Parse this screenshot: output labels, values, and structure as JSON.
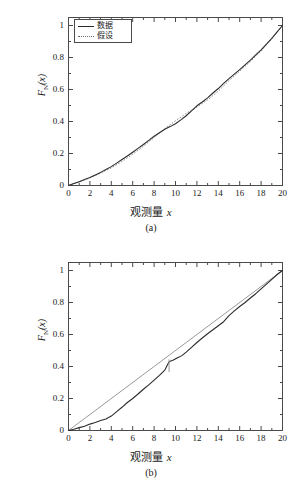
{
  "figure": {
    "background_color": "#ffffff",
    "data_line_color": "#2b2b2b",
    "hypothesis_line_color": "#8c8c8c",
    "axis_color": "#4a4a4a"
  },
  "panels": [
    {
      "id": "a",
      "caption": "(a)",
      "xlabel_cn": "观测量",
      "xlabel_var": "x",
      "ylabel_main": "F",
      "ylabel_sub": "N",
      "ylabel_arg": "(x)",
      "legend": {
        "visible": true,
        "items": [
          {
            "label": "数据",
            "style": "solid"
          },
          {
            "label": "假设",
            "style": "dotted"
          }
        ]
      }
    },
    {
      "id": "b",
      "caption": "(b)",
      "xlabel_cn": "观测量",
      "xlabel_var": "x",
      "ylabel_main": "F",
      "ylabel_sub": "N",
      "ylabel_arg": "(x)",
      "legend": {
        "visible": false,
        "items": []
      }
    }
  ],
  "bottom_text": "",
  "chart_data": [
    {
      "type": "line",
      "panel": "a",
      "title": "(a)",
      "xlabel": "观测量 x",
      "ylabel": "F_N(x)",
      "xlim": [
        0,
        20
      ],
      "ylim": [
        0,
        1.05
      ],
      "xticks": [
        0,
        2,
        4,
        6,
        8,
        10,
        12,
        14,
        16,
        18,
        20
      ],
      "yticks": [
        0,
        0.2,
        0.4,
        0.6,
        0.8,
        1
      ],
      "grid": false,
      "legend": [
        "数据",
        "假设"
      ],
      "legend_position": "upper-left",
      "series": [
        {
          "name": "数据",
          "style": "solid",
          "color": "#2b2b2b",
          "x": [
            0,
            0.5,
            1,
            1.5,
            2,
            2.5,
            3,
            3.5,
            4,
            4.5,
            5,
            5.5,
            6,
            6.5,
            7,
            7.5,
            8,
            8.5,
            9,
            9.5,
            10,
            10.5,
            11,
            11.5,
            12,
            12.5,
            13,
            13.5,
            14,
            14.5,
            15,
            15.5,
            16,
            16.5,
            17,
            17.5,
            18,
            18.5,
            19,
            19.5,
            20
          ],
          "y": [
            0.0,
            0.012,
            0.024,
            0.037,
            0.05,
            0.066,
            0.082,
            0.1,
            0.118,
            0.14,
            0.162,
            0.184,
            0.208,
            0.232,
            0.256,
            0.282,
            0.308,
            0.33,
            0.352,
            0.368,
            0.386,
            0.41,
            0.436,
            0.466,
            0.498,
            0.522,
            0.548,
            0.578,
            0.606,
            0.638,
            0.668,
            0.696,
            0.724,
            0.754,
            0.784,
            0.816,
            0.848,
            0.884,
            0.92,
            0.96,
            1.0
          ]
        },
        {
          "name": "假设",
          "style": "dotted",
          "color": "#8c8c8c",
          "x": [
            0,
            1,
            2,
            3,
            4,
            5,
            6,
            7,
            8,
            9,
            10,
            11,
            12,
            13,
            14,
            15,
            16,
            17,
            18,
            19,
            20
          ],
          "y": [
            0.0,
            0.023,
            0.048,
            0.077,
            0.11,
            0.15,
            0.195,
            0.245,
            0.3,
            0.355,
            0.405,
            0.45,
            0.49,
            0.535,
            0.59,
            0.655,
            0.715,
            0.775,
            0.84,
            0.918,
            1.0
          ]
        }
      ]
    },
    {
      "type": "line",
      "panel": "b",
      "title": "(b)",
      "xlabel": "观测量 x",
      "ylabel": "F_N(x)",
      "xlim": [
        0,
        20
      ],
      "ylim": [
        0,
        1.05
      ],
      "xticks": [
        0,
        2,
        4,
        6,
        8,
        10,
        12,
        14,
        16,
        18,
        20
      ],
      "yticks": [
        0,
        0.2,
        0.4,
        0.6,
        0.8,
        1
      ],
      "grid": false,
      "legend": [],
      "annotations": [
        {
          "type": "ks-distance-marker",
          "x": 9.4,
          "y_low": 0.365,
          "y_high": 0.445
        }
      ],
      "series": [
        {
          "name": "数据",
          "style": "solid",
          "color": "#2b2b2b",
          "x": [
            0,
            0.5,
            1,
            1.5,
            2,
            2.5,
            3,
            3.5,
            4,
            4.5,
            5,
            5.5,
            6,
            6.5,
            7,
            7.5,
            8,
            8.5,
            9,
            9.4,
            9.8,
            10.2,
            10.6,
            11,
            11.5,
            12,
            12.5,
            13,
            13.5,
            14,
            14.5,
            15,
            15.5,
            16,
            16.5,
            17,
            17.5,
            18,
            18.5,
            19,
            19.5,
            20
          ],
          "y": [
            0.0,
            0.008,
            0.018,
            0.027,
            0.04,
            0.05,
            0.062,
            0.072,
            0.09,
            0.118,
            0.145,
            0.175,
            0.2,
            0.228,
            0.258,
            0.285,
            0.315,
            0.345,
            0.378,
            0.43,
            0.44,
            0.455,
            0.468,
            0.49,
            0.52,
            0.55,
            0.578,
            0.605,
            0.63,
            0.655,
            0.68,
            0.718,
            0.748,
            0.775,
            0.8,
            0.828,
            0.855,
            0.885,
            0.915,
            0.945,
            0.975,
            1.0
          ]
        },
        {
          "name": "假设",
          "style": "solid-thin",
          "color": "#9a9a9a",
          "x": [
            0,
            20
          ],
          "y": [
            0.0,
            1.0
          ]
        }
      ]
    }
  ]
}
